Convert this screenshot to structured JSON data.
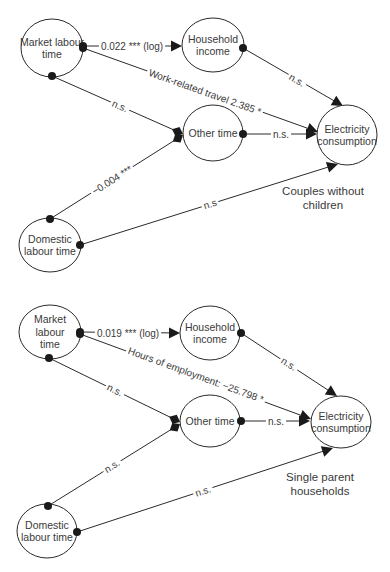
{
  "figure": {
    "panels": [
      {
        "id": "couples",
        "title_lines": [
          "Couples without",
          "children"
        ],
        "title_pos": [
          323,
          195
        ],
        "nodes": [
          {
            "id": "market",
            "lines": [
              "Market labour",
              "time"
            ],
            "cx": 52,
            "cy": 48,
            "rx": 31,
            "ry": 29
          },
          {
            "id": "income",
            "lines": [
              "Household",
              "income"
            ],
            "cx": 213,
            "cy": 45,
            "rx": 31,
            "ry": 27
          },
          {
            "id": "other",
            "lines": [
              "Other time"
            ],
            "cx": 213,
            "cy": 133,
            "rx": 30,
            "ry": 28
          },
          {
            "id": "elec",
            "lines": [
              "Electricity",
              "consumption"
            ],
            "cx": 347,
            "cy": 135,
            "rx": 30,
            "ry": 30
          },
          {
            "id": "domestic",
            "lines": [
              "Domestic",
              "labour time"
            ],
            "cx": 50,
            "cy": 245,
            "rx": 31,
            "ry": 27
          }
        ],
        "edges": [
          {
            "from": "market",
            "to": "income",
            "start": [
              83,
              46
            ],
            "end": [
              182,
              46
            ],
            "head": "triangle",
            "label": "0.022 *** (log)",
            "label_pos": [
              132,
              46
            ],
            "label_angle": 0
          },
          {
            "from": "market",
            "to": "elec",
            "start": [
              83,
              48
            ],
            "end": [
              318,
              132
            ],
            "head": "triangle",
            "label": "Work-related travel 2.385 *",
            "label_pos": [
              205,
              92
            ],
            "label_angle": 19.6
          },
          {
            "from": "market",
            "to": "other",
            "start": [
              52,
              76
            ],
            "end": [
              183,
              134
            ],
            "head": "diamond",
            "label": "n.s.",
            "label_pos": [
              120,
              106
            ],
            "label_angle": 23.9
          },
          {
            "from": "income",
            "to": "elec",
            "start": [
              243,
              48
            ],
            "end": [
              343,
              106
            ],
            "head": "triangle",
            "label": "n.s.",
            "label_pos": [
              297,
              80
            ],
            "label_angle": 30
          },
          {
            "from": "other",
            "to": "elec",
            "start": [
              243,
              134
            ],
            "end": [
              317,
              134
            ],
            "head": "triangle",
            "label": "n.s.",
            "label_pos": [
              281,
              134
            ],
            "label_angle": 0
          },
          {
            "from": "domestic",
            "to": "other",
            "start": [
              50,
              219
            ],
            "end": [
              183,
              135
            ],
            "head": "diamond",
            "label": "−0.004 ***",
            "label_pos": [
              112,
              180
            ],
            "label_angle": -32.3
          },
          {
            "from": "domestic",
            "to": "elec",
            "start": [
              80,
              245
            ],
            "end": [
              338,
              164
            ],
            "head": "triangle",
            "label": "n.s",
            "label_pos": [
              210,
              204
            ],
            "label_angle": -17.4
          }
        ]
      },
      {
        "id": "single-parent",
        "title_lines": [
          "Single parent",
          "households"
        ],
        "title_pos": [
          320,
          481
        ],
        "nodes": [
          {
            "id": "market",
            "lines": [
              "Market",
              "labour",
              "time"
            ],
            "cx": 50,
            "cy": 332,
            "rx": 31,
            "ry": 27
          },
          {
            "id": "income",
            "lines": [
              "Household",
              "income"
            ],
            "cx": 210,
            "cy": 333,
            "rx": 30,
            "ry": 27
          },
          {
            "id": "other",
            "lines": [
              "Other time"
            ],
            "cx": 210,
            "cy": 421,
            "rx": 30,
            "ry": 26
          },
          {
            "id": "elec",
            "lines": [
              "Electricity",
              "consumption"
            ],
            "cx": 341,
            "cy": 422,
            "rx": 30,
            "ry": 26
          },
          {
            "id": "domestic",
            "lines": [
              "Domestic",
              "labour time"
            ],
            "cx": 47,
            "cy": 531,
            "rx": 30,
            "ry": 27
          }
        ],
        "edges": [
          {
            "from": "market",
            "to": "income",
            "start": [
              80,
              332
            ],
            "end": [
              180,
              333
            ],
            "head": "triangle",
            "label": "0.019 *** (log)",
            "label_pos": [
              128,
              333
            ],
            "label_angle": 0
          },
          {
            "from": "market",
            "to": "elec",
            "start": [
              80,
              334
            ],
            "end": [
              311,
              419
            ],
            "head": "triangle",
            "label": "Hours of employment: −25.798 *",
            "label_pos": [
              196,
              375
            ],
            "label_angle": 20.2
          },
          {
            "from": "market",
            "to": "other",
            "start": [
              49,
              358
            ],
            "end": [
              180,
              422
            ],
            "head": "diamond",
            "label": "n.s.",
            "label_pos": [
              115,
              390
            ],
            "label_angle": 26
          },
          {
            "from": "income",
            "to": "elec",
            "start": [
              241,
              333
            ],
            "end": [
              337,
              396
            ],
            "head": "triangle",
            "label": "n.s.",
            "label_pos": [
              289,
              364
            ],
            "label_angle": 33
          },
          {
            "from": "other",
            "to": "elec",
            "start": [
              241,
              421
            ],
            "end": [
              310,
              421
            ],
            "head": "triangle",
            "label": "n.s.",
            "label_pos": [
              276,
              421
            ],
            "label_angle": 0
          },
          {
            "from": "domestic",
            "to": "other",
            "start": [
              48,
              506
            ],
            "end": [
              180,
              424
            ],
            "head": "diamond",
            "label": "n.s.",
            "label_pos": [
              112,
              466
            ],
            "label_angle": -31.9
          },
          {
            "from": "domestic",
            "to": "elec",
            "start": [
              77,
              532
            ],
            "end": [
              333,
              448
            ],
            "head": "triangle",
            "label": "n.s.",
            "label_pos": [
              203,
              491
            ],
            "label_angle": -18.2
          }
        ]
      }
    ],
    "colors": {
      "line": "#2a2a2a",
      "text": "#3a3a3a",
      "background": "#ffffff"
    }
  }
}
